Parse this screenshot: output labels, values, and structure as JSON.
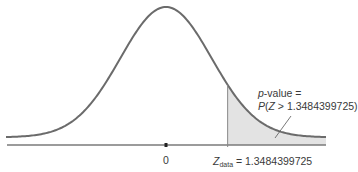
{
  "chart_data": {
    "type": "area",
    "title": "",
    "distribution": "standard normal",
    "x_range": [
      -3.5,
      3.5
    ],
    "mean_label": "0",
    "z_data": 1.3484399725,
    "shaded_region": "right tail, Z > 1.3484399725",
    "annotation": {
      "line1_prefix": "p",
      "line1_rest": "-value =",
      "line2_p": "P",
      "line2_open": "(",
      "line2_z": "Z",
      "line2_rest": " > 1.3484399725)"
    },
    "zdata_label": {
      "z": "Z",
      "sub": "data",
      "rest": " = 1.3484399725"
    },
    "colors": {
      "curve": "#6b6b6b",
      "axis": "#7a7a7a",
      "shade": "#e3e3e3"
    },
    "xlabel": "",
    "ylabel": "",
    "grid": false,
    "legend": null
  }
}
